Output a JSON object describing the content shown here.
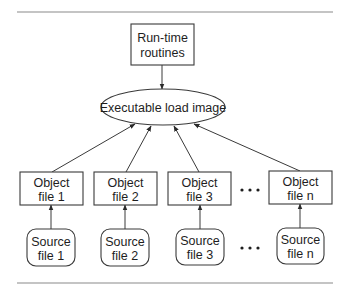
{
  "diagram": {
    "nodes": {
      "runtime": {
        "id": "runtime",
        "line1": "Run-time",
        "line2": "routines",
        "shape": "rect",
        "x": 131,
        "y": 24,
        "w": 63,
        "h": 41
      },
      "executable": {
        "id": "executable",
        "label": "Executable load image",
        "shape": "ellipse",
        "cx": 163,
        "cy": 107,
        "rx": 62,
        "ry": 18
      },
      "objects": [
        {
          "id": "object-1",
          "line1": "Object",
          "line2": "file 1",
          "shape": "rect",
          "x": 20,
          "y": 172,
          "w": 63,
          "h": 33
        },
        {
          "id": "object-2",
          "line1": "Object",
          "line2": "file 2",
          "shape": "rect",
          "x": 94,
          "y": 172,
          "w": 63,
          "h": 33
        },
        {
          "id": "object-3",
          "line1": "Object",
          "line2": "file 3",
          "shape": "rect",
          "x": 168,
          "y": 172,
          "w": 63,
          "h": 33
        },
        {
          "id": "object-n",
          "line1": "Object",
          "line2": "file n",
          "shape": "rect",
          "x": 269,
          "y": 171,
          "w": 63,
          "h": 33
        }
      ],
      "sources": [
        {
          "id": "source-1",
          "line1": "Source",
          "line2": "file 1",
          "shape": "rounded-rect",
          "x": 27,
          "y": 229,
          "w": 48,
          "h": 37
        },
        {
          "id": "source-2",
          "line1": "Source",
          "line2": "file 2",
          "shape": "rounded-rect",
          "x": 101,
          "y": 229,
          "w": 48,
          "h": 37
        },
        {
          "id": "source-3",
          "line1": "Source",
          "line2": "file 3",
          "shape": "rounded-rect",
          "x": 176,
          "y": 229,
          "w": 48,
          "h": 36
        },
        {
          "id": "source-n",
          "line1": "Source",
          "line2": "file n",
          "shape": "rounded-rect",
          "x": 277,
          "y": 228,
          "w": 47,
          "h": 36
        }
      ]
    },
    "edges": [
      {
        "from": "runtime",
        "to": "executable",
        "x1": 162,
        "y1": 65,
        "x2": 162,
        "y2": 89
      },
      {
        "from": "object-1",
        "to": "executable",
        "x1": 52,
        "y1": 172,
        "x2": 135,
        "y2": 124
      },
      {
        "from": "object-2",
        "to": "executable",
        "x1": 126,
        "y1": 172,
        "x2": 151,
        "y2": 126
      },
      {
        "from": "object-3",
        "to": "executable",
        "x1": 199,
        "y1": 172,
        "x2": 174,
        "y2": 126
      },
      {
        "from": "object-n",
        "to": "executable",
        "x1": 300,
        "y1": 171,
        "x2": 194,
        "y2": 124
      },
      {
        "from": "source-1",
        "to": "object-1",
        "x1": 51,
        "y1": 229,
        "x2": 51,
        "y2": 205
      },
      {
        "from": "source-2",
        "to": "object-2",
        "x1": 125,
        "y1": 229,
        "x2": 125,
        "y2": 205
      },
      {
        "from": "source-3",
        "to": "object-3",
        "x1": 200,
        "y1": 229,
        "x2": 200,
        "y2": 205
      },
      {
        "from": "source-n",
        "to": "object-n",
        "x1": 300,
        "y1": 228,
        "x2": 300,
        "y2": 204
      }
    ],
    "ellipsis": [
      {
        "id": "object-ellipsis",
        "x": 250,
        "y": 190
      },
      {
        "id": "source-ellipsis",
        "x": 250,
        "y": 248
      }
    ],
    "rules": [
      {
        "id": "top-rule",
        "x1": 17,
        "x2": 333,
        "y": 12
      },
      {
        "id": "bottom-rule",
        "x1": 17,
        "x2": 333,
        "y": 283
      }
    ]
  }
}
